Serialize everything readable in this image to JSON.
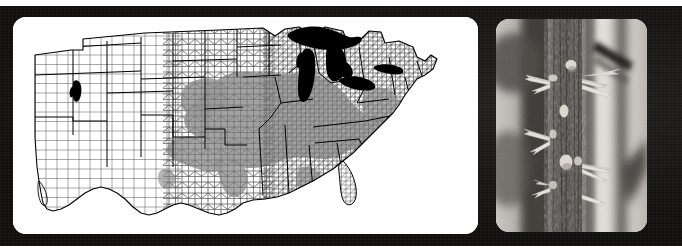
{
  "figure": {
    "background_color": "#100f0d",
    "page_edge_color": "#ffffff",
    "panel_count": 2
  },
  "map_panel": {
    "name": "distribution-map",
    "description": "Black and white county-level outline map of the contiguous United States with a shaded gray range overlay",
    "background_color": "#ffffff",
    "county_line_color": "#3a3a3a",
    "state_line_color": "#000000",
    "shaded_range_color": "#9a9a9a",
    "water_color": "#000000",
    "water_features": [
      "Lake Superior",
      "Lake Michigan",
      "Lake Huron",
      "Lake Erie",
      "Lake Ontario",
      "Great Salt Lake"
    ],
    "shaded_region_label": "Distribution range (shaded counties)",
    "shaded_states": [
      "Illinois",
      "Indiana",
      "Ohio",
      "Missouri",
      "Iowa",
      "Kansas",
      "Oklahoma",
      "Arkansas",
      "Kentucky",
      "Tennessee",
      "Nebraska",
      "Mississippi",
      "Alabama",
      "Texas",
      "Pennsylvania",
      "West Virginia"
    ],
    "corner_radius_px": 13
  },
  "photo_panel": {
    "name": "thorny-stem-photograph",
    "description": "Black and white close-up photograph of a thorny woody stem with branched thorns and pale lenticels, blurred woodland background",
    "corner_radius_px": 13,
    "subject": "thorny trunk / branched spines",
    "tones": {
      "bark_dark": "#4a4643",
      "thorn_light": "#ececea",
      "background_light": "#d9d7d2",
      "background_dark": "#3b3936"
    }
  }
}
